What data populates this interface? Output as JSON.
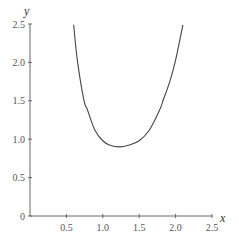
{
  "chart_data": {
    "type": "line",
    "title": "",
    "xlabel": "x",
    "ylabel": "y",
    "xlim": [
      0,
      2.5
    ],
    "ylim": [
      0,
      2.5
    ],
    "grid": false,
    "legend": null,
    "x_ticks": [
      "0.5",
      "1.0",
      "1.5",
      "2.0",
      "2.5"
    ],
    "y_ticks": [
      "0",
      "0.5",
      "1.0",
      "1.5",
      "2.0",
      "2.5"
    ],
    "series": [
      {
        "name": "curve",
        "x": [
          0.6,
          0.65,
          0.74,
          0.79,
          0.89,
          1.0,
          1.1,
          1.23,
          1.35,
          1.5,
          1.64,
          1.78,
          1.83,
          1.92,
          2.0,
          2.1
        ],
        "y": [
          2.49,
          2.03,
          1.51,
          1.38,
          1.12,
          0.98,
          0.92,
          0.9,
          0.92,
          0.98,
          1.12,
          1.38,
          1.51,
          1.75,
          2.03,
          2.49
        ]
      }
    ]
  },
  "axes": {
    "x_label": "x",
    "y_label": "y",
    "origin_label": "0"
  }
}
